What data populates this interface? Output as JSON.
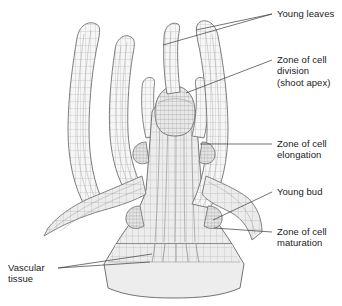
{
  "figure": {
    "colors": {
      "ink": "#5a5a5a",
      "outline": "#6b6b6b",
      "fill_body": "#ededed",
      "fill_leaf": "#f4f4f4",
      "fill_base": "#e8e8e8",
      "cell_line": "#9a9a9a",
      "text": "#1b1b1b",
      "leader": "#3a3a3a",
      "background": "#ffffff"
    }
  },
  "labels": {
    "young_leaves": {
      "line1": "Young leaves"
    },
    "zone_division": {
      "line1": "Zone of cell",
      "line2": "division",
      "line3": "(shoot apex)"
    },
    "zone_elongation": {
      "line1": "Zone of cell",
      "line2": "elongation"
    },
    "young_bud": {
      "line1": "Young bud"
    },
    "zone_maturation": {
      "line1": "Zone of cell",
      "line2": "maturation"
    },
    "vascular_tissue": {
      "line1": "Vascular",
      "line2": "tissue"
    }
  }
}
